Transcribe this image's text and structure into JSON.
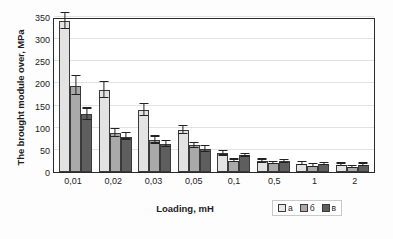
{
  "chart_data": {
    "type": "bar",
    "title": "",
    "xlabel": "Loading, mH",
    "ylabel": "The brought module over, MPa",
    "categories": [
      "0,01",
      "0,02",
      "0,03",
      "0,05",
      "0,1",
      "0,5",
      "1",
      "2"
    ],
    "ylim": [
      0,
      350
    ],
    "yticks": [
      0,
      50,
      100,
      150,
      200,
      250,
      300,
      350
    ],
    "grid": true,
    "legend_position": "bottom-right",
    "series": [
      {
        "name": "а",
        "color": "#e3e3e3",
        "values": [
          340,
          185,
          140,
          95,
          42,
          24,
          19,
          16
        ],
        "errors": [
          18,
          18,
          14,
          9,
          5,
          4,
          3,
          3
        ]
      },
      {
        "name": "б",
        "color": "#a9a9a9",
        "values": [
          195,
          88,
          72,
          60,
          25,
          20,
          14,
          11
        ],
        "errors": [
          22,
          9,
          8,
          6,
          3,
          3,
          3,
          3
        ]
      },
      {
        "name": "в",
        "color": "#5e5e5e",
        "values": [
          130,
          80,
          63,
          52,
          38,
          24,
          18,
          16
        ],
        "errors": [
          13,
          7,
          6,
          7,
          3,
          3,
          3,
          3
        ]
      }
    ]
  },
  "legend": {
    "items": [
      {
        "label": "а"
      },
      {
        "label": "б"
      },
      {
        "label": "в"
      }
    ]
  },
  "axis": {
    "y_title": "The brought module over, MPa",
    "x_title": "Loading, mH",
    "y_tick_labels": [
      "350",
      "300",
      "250",
      "200",
      "150",
      "100",
      "50",
      "0"
    ],
    "x_tick_labels": [
      "0,01",
      "0,02",
      "0,03",
      "0,05",
      "0,1",
      "0,5",
      "1",
      "2"
    ]
  },
  "colors": {
    "series_a": "#e3e3e3",
    "series_b": "#a9a9a9",
    "series_v": "#5e5e5e",
    "axis": "#2a2a2a",
    "grid": "#e2e2e2"
  }
}
